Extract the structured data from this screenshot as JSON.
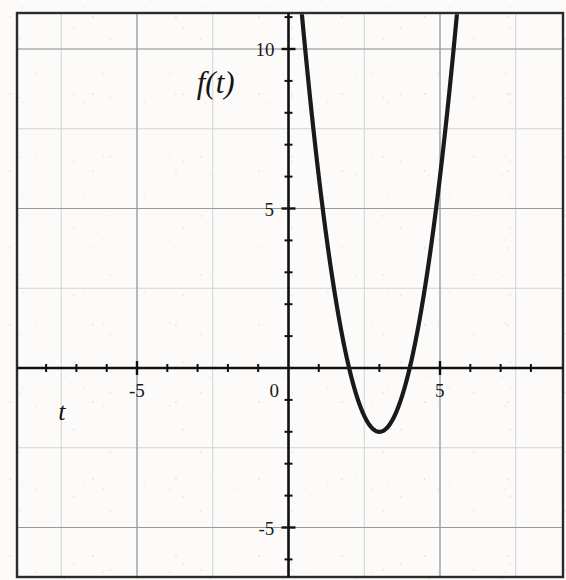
{
  "figure": {
    "width": 566,
    "height": 580,
    "background_color": "#fcfbf9",
    "frame_color": "#2b2b2b",
    "major_grid_color": "#9a9a9a",
    "minor_grid_color": "#d2d2d2",
    "curve_color": "#1a1a1a",
    "axis_color": "#111111"
  },
  "labels": {
    "y_axis_name": "f(t)",
    "x_axis_name": "t",
    "y_ticks": [
      {
        "value": 10,
        "text": "10"
      },
      {
        "value": 5,
        "text": "5"
      },
      {
        "value": -5,
        "text": "-5"
      }
    ],
    "x_ticks": [
      {
        "value": -5,
        "text": "-5"
      },
      {
        "value": 0,
        "text": "0"
      },
      {
        "value": 5,
        "text": "5"
      }
    ]
  },
  "chart_data": {
    "type": "line",
    "title": "",
    "xlabel": "t",
    "ylabel": "f(t)",
    "xlim": [
      -9,
      9.2
    ],
    "ylim": [
      -6.5,
      11.5
    ],
    "grid": true,
    "major_grid_step": 5,
    "minor_grid_step": 2.5,
    "tick_step": 1,
    "legend": "none",
    "annotations": {
      "vertex": [
        3,
        -2
      ],
      "roots": [
        2,
        4
      ],
      "equation": "f(t) = 2(t-3)^2 - 2",
      "leading_coefficient": 2,
      "axis_of_symmetry": 3,
      "y_intercept": 16
    },
    "series": [
      {
        "name": "f(t)",
        "x": [
          1.0,
          1.2,
          1.4,
          1.6,
          1.8,
          2.0,
          2.2,
          2.4,
          2.6,
          2.8,
          3.0,
          3.2,
          3.4,
          3.6,
          3.8,
          4.0,
          4.2,
          4.4,
          4.6,
          4.8,
          5.0,
          5.2,
          5.4,
          5.6
        ],
        "y": [
          6.0,
          4.48,
          3.12,
          1.92,
          0.88,
          0.0,
          -0.72,
          -1.28,
          -1.68,
          -1.92,
          -2.0,
          -1.92,
          -1.68,
          -1.28,
          -0.72,
          0.0,
          0.88,
          1.92,
          3.12,
          4.48,
          6.0,
          7.68,
          9.52,
          11.52
        ]
      }
    ]
  },
  "axes_geometry": {
    "origin_px": [
      288.5,
      368
    ],
    "x_unit_px": 30.3,
    "y_unit_px": 31.9,
    "frame_px": {
      "left": 17,
      "top": 13,
      "right": 563,
      "bottom": 577
    }
  }
}
